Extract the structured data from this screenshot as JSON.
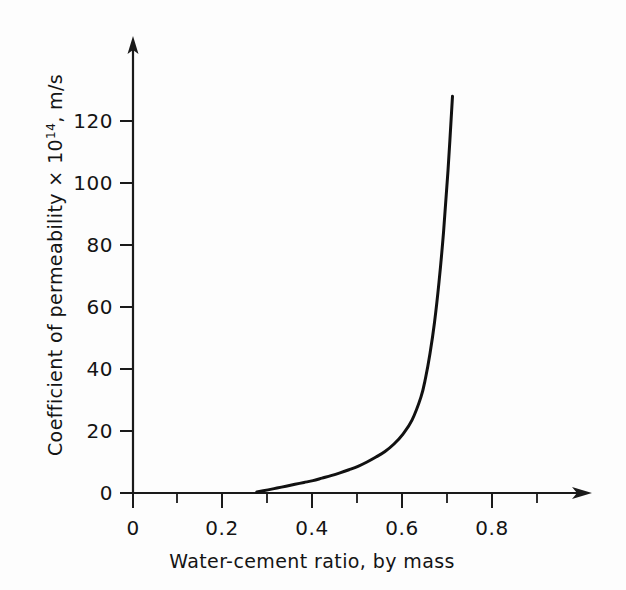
{
  "chart_data": {
    "type": "line",
    "title": "",
    "subtitle": "",
    "xlabel": "Water-cement ratio, by mass",
    "ylabel_main": "Coefficient of permeability × 10",
    "ylabel_exponent": "14",
    "ylabel_tail": ", m/s",
    "ylabel_full": "Coefficient of permeability × 10¹⁴, m/s",
    "xlim": [
      0,
      1.0
    ],
    "ylim": [
      0,
      140
    ],
    "grid": false,
    "legend": null,
    "x_ticks": [
      0,
      0.2,
      0.4,
      0.6,
      0.8
    ],
    "x_tick_labels": [
      "0",
      "0.2",
      "0.4",
      "0.6",
      "0.8"
    ],
    "x_minor_ticks": [
      0.1,
      0.3,
      0.5,
      0.7,
      0.9
    ],
    "y_ticks": [
      0,
      20,
      40,
      60,
      80,
      100,
      120
    ],
    "y_tick_labels": [
      "0",
      "20",
      "40",
      "60",
      "80",
      "100",
      "120"
    ],
    "series": [
      {
        "name": "permeability",
        "x": [
          0.275,
          0.3,
          0.32,
          0.34,
          0.36,
          0.38,
          0.4,
          0.42,
          0.44,
          0.46,
          0.48,
          0.5,
          0.52,
          0.54,
          0.56,
          0.58,
          0.6,
          0.62,
          0.64,
          0.65,
          0.66,
          0.67,
          0.68,
          0.69,
          0.7,
          0.71
        ],
        "y": [
          0.3,
          1.0,
          1.6,
          2.2,
          2.8,
          3.4,
          4.0,
          4.8,
          5.6,
          6.5,
          7.5,
          8.6,
          10.0,
          11.6,
          13.4,
          15.8,
          19.0,
          23.5,
          31.0,
          37.0,
          45.0,
          55.0,
          68.0,
          84.0,
          104.0,
          128.0
        ]
      }
    ],
    "annotations": [],
    "colors": {
      "curve": "#111111",
      "axis": "#1a1a1a",
      "background": "#fdfdfd",
      "text": "#141414"
    }
  },
  "axes": {
    "y_arrow": true,
    "x_arrow": true,
    "x_axis_label": "Water-cement ratio, by mass"
  }
}
